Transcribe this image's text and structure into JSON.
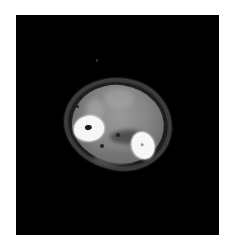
{
  "image": {
    "kind": "CT axial cross-section",
    "subject": "forearm cross-section showing two bones",
    "background_color": "#ffffff",
    "frame_color": "#000000",
    "bone_color": "#f7f7f7",
    "soft_tissue_color": "#858585",
    "structures": [
      {
        "name": "left-bone",
        "description": "bright cortical bone ring with dark marrow cavity"
      },
      {
        "name": "right-bone",
        "description": "bright oval bone with small central cavity"
      },
      {
        "name": "soft-tissue",
        "description": "grey muscle mass within thin skin outline"
      }
    ]
  }
}
